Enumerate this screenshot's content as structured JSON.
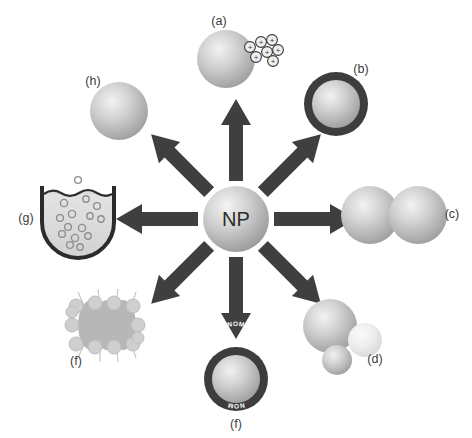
{
  "figure": {
    "center_label": "NP",
    "background_color": "#ffffff",
    "arrow_color": "#3f3f3f",
    "sphere_color": "#b9b9b9",
    "shell_color": "#3d3d3d"
  },
  "panels": [
    {
      "key": "a",
      "label": "(a)",
      "icon": "sphere-with-positive-charges",
      "direction": "up",
      "angle_deg": 90,
      "charge_symbol": "+",
      "charge_count": 7
    },
    {
      "key": "b",
      "label": "(b)",
      "icon": "sphere-with-coating-shell",
      "direction": "up-right",
      "angle_deg": 45
    },
    {
      "key": "c",
      "label": "(c)",
      "icon": "two-aggregated-spheres",
      "direction": "right",
      "angle_deg": 0,
      "sphere_count": 2
    },
    {
      "key": "d",
      "label": "(d)",
      "icon": "dissolving-spheres",
      "direction": "down-right",
      "angle_deg": -45,
      "sphere_count": 3
    },
    {
      "key": "e",
      "label": "(e)",
      "icon": "sphere-with-nom-coating",
      "direction": "down",
      "angle_deg": -90,
      "shell_text_top": "NOM",
      "shell_text_bottom": "NOM"
    },
    {
      "key": "f",
      "label": "(f)",
      "icon": "cell-membrane-interaction",
      "direction": "down-left",
      "angle_deg": -135,
      "ellipse_count": 3,
      "bead_count": 12
    },
    {
      "key": "g",
      "label": "(g)",
      "icon": "beaker-with-suspended-particles",
      "direction": "left",
      "angle_deg": 180
    },
    {
      "key": "h",
      "label": "(h)",
      "icon": "plain-sphere",
      "direction": "up-left",
      "angle_deg": 135
    }
  ]
}
